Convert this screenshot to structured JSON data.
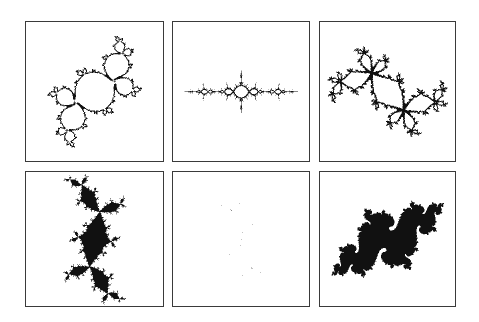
{
  "figure": {
    "layout": {
      "rows": 2,
      "columns": 3
    },
    "colors": {
      "ink": "#111111",
      "frame": "#3a3a3a",
      "background": "#ffffff"
    },
    "panels": [
      {
        "id": "p0",
        "row": 1,
        "col": 1,
        "subject": "connected julia set with fan-like spokes (cauliflower / parabolic type)",
        "c_re": -0.12,
        "c_im": 0.665,
        "mode": "boundary",
        "rotate": 90,
        "scale": 1.55
      },
      {
        "id": "p1",
        "row": 1,
        "col": 2,
        "subject": "horizontal chain of bulbs along real axis (airplane type)",
        "c_re": -1.31,
        "c_im": 0.0,
        "mode": "boundary",
        "rotate": 0,
        "scale": 2.1
      },
      {
        "id": "p2",
        "row": 1,
        "col": 3,
        "subject": "connected julia set with two spiral centres and bulbs (rabbit-like)",
        "c_re": 0.285,
        "c_im": 0.535,
        "mode": "boundary",
        "rotate": -40,
        "scale": 1.45
      },
      {
        "id": "p3",
        "row": 2,
        "col": 1,
        "subject": "disconnected fatou dust with star-shaped clusters",
        "c_re": -0.11,
        "c_im": 0.8,
        "mode": "filled",
        "rotate": 40,
        "scale": 1.4
      },
      {
        "id": "p4",
        "row": 2,
        "col": 2,
        "subject": "dendrite julia set (c = i)",
        "c_re": 0.0,
        "c_im": 1.0,
        "mode": "filled",
        "rotate": 15,
        "scale": 1.55
      },
      {
        "id": "p5",
        "row": 2,
        "col": 3,
        "subject": "filled julia set with two dark spirals (seahorse type)",
        "c_re": -0.745,
        "c_im": 0.113,
        "mode": "filled",
        "rotate": -35,
        "scale": 1.5
      }
    ]
  }
}
